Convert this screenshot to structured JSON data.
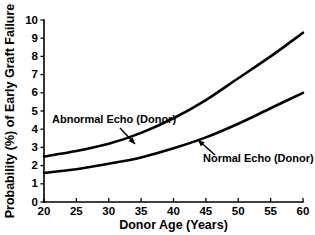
{
  "chart_data": {
    "type": "line",
    "title": "",
    "xlabel": "Donor Age (Years)",
    "ylabel": "Probability (%) of Early Graft Failure",
    "xlim": [
      20,
      60
    ],
    "ylim": [
      0,
      10
    ],
    "xticks": [
      20,
      25,
      30,
      35,
      40,
      45,
      50,
      55,
      60
    ],
    "yticks": [
      0,
      1,
      2,
      3,
      4,
      5,
      6,
      7,
      8,
      9,
      10
    ],
    "grid": false,
    "legend_position": "inline-annotations",
    "x": [
      20,
      25,
      30,
      35,
      40,
      45,
      50,
      55,
      60
    ],
    "series": [
      {
        "name": "Abnormal Echo (Donor)",
        "values": [
          2.5,
          2.8,
          3.2,
          3.8,
          4.6,
          5.6,
          6.8,
          8.0,
          9.3
        ],
        "color": "#000000"
      },
      {
        "name": "Normal Echo (Donor)",
        "values": [
          1.6,
          1.8,
          2.1,
          2.45,
          2.95,
          3.55,
          4.3,
          5.15,
          6.0
        ],
        "color": "#000000"
      }
    ],
    "annotations": [
      {
        "text": "Abnormal Echo (Donor)",
        "text_x": 52,
        "text_y": 123,
        "arrow_from_x": 120,
        "arrow_from_y": 128,
        "arrow_to_x": 135,
        "arrow_to_y": 144
      },
      {
        "text": "Normal Echo (Donor)",
        "text_x": 203,
        "text_y": 162,
        "arrow_from_x": 215,
        "arrow_from_y": 155,
        "arrow_to_x": 198,
        "arrow_to_y": 140
      }
    ]
  },
  "axes_geometry": {
    "left_px": 44,
    "right_px": 303,
    "top_px": 20,
    "bottom_px": 202
  }
}
